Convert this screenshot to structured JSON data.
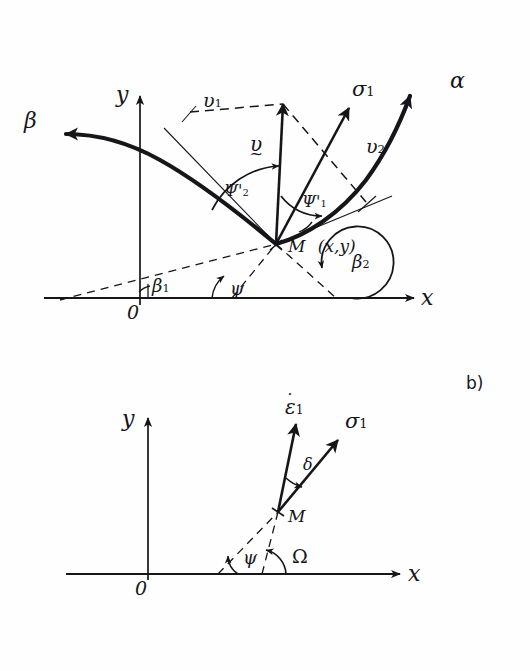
{
  "figure": {
    "title_tag": "b)",
    "background": "#fefefe",
    "ink": "#16161a"
  },
  "panel_a": {
    "axes": {
      "y_label": "y",
      "x_label": "x",
      "origin_label": "0"
    },
    "curves": [
      {
        "name": "beta-characteristic",
        "label": "β"
      },
      {
        "name": "alpha-characteristic",
        "label": "α"
      }
    ],
    "point": {
      "name_label": "M",
      "coords_label": "(x,y)"
    },
    "vectors": [
      {
        "name": "velocity-resultant",
        "label": "υ",
        "accent": "tilde"
      },
      {
        "name": "velocity-component-1",
        "label": "υ",
        "sub": "1",
        "style": "dashed"
      },
      {
        "name": "velocity-component-2",
        "label": "υ",
        "sub": "2",
        "style": "dashed"
      },
      {
        "name": "principal-stress",
        "label": "σ",
        "sub": "1"
      }
    ],
    "angles": [
      {
        "name": "psi-prime-2",
        "label": "Ψ",
        "sub": "2",
        "prime": "'"
      },
      {
        "name": "psi-prime-1",
        "label": "Ψ",
        "sub": "1",
        "prime": "'"
      },
      {
        "name": "beta-1",
        "label": "β",
        "sub": "1"
      },
      {
        "name": "beta-2",
        "label": "β",
        "sub": "2"
      },
      {
        "name": "psi",
        "label": "ψ"
      }
    ]
  },
  "panel_b": {
    "axes": {
      "y_label": "y",
      "x_label": "x",
      "origin_label": "0"
    },
    "point": {
      "name_label": "M"
    },
    "vectors": [
      {
        "name": "strain-rate",
        "label": "ε",
        "sub": "1",
        "accent": "dot"
      },
      {
        "name": "principal-stress",
        "label": "σ",
        "sub": "1"
      }
    ],
    "angles": [
      {
        "name": "delta",
        "label": "δ"
      },
      {
        "name": "psi",
        "label": "ψ"
      },
      {
        "name": "omega",
        "label": "Ω"
      }
    ]
  }
}
